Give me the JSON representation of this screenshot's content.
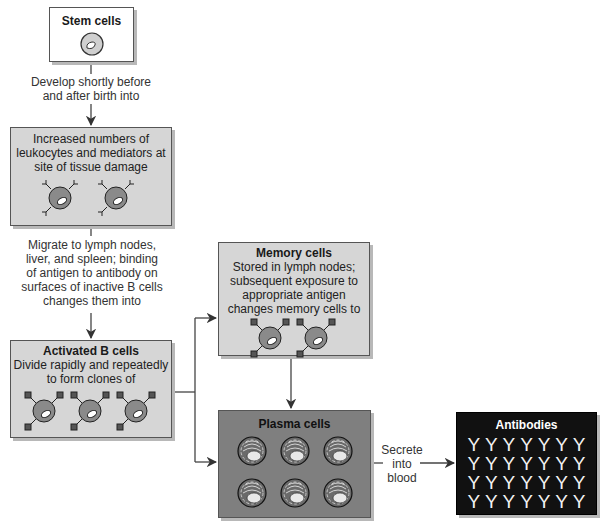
{
  "diagram": {
    "type": "flowchart",
    "topic": "B cell development and antibody production"
  },
  "nodes": {
    "stem": {
      "title": "Stem cells",
      "cells": 1
    },
    "leukocytes": {
      "text_lines": [
        "Increased numbers of",
        "leukocytes and mediators at",
        "site of tissue damage"
      ],
      "cells": 2
    },
    "activated": {
      "title": "Activated B cells",
      "text_lines": [
        "Divide rapidly and repeatedly",
        "to form clones of"
      ],
      "cells": 3
    },
    "memory": {
      "title": "Memory cells",
      "text_lines": [
        "Stored in lymph nodes;",
        "subsequent exposure to",
        "appropriate antigen",
        "changes memory cells to"
      ],
      "cells": 2
    },
    "plasma": {
      "title": "Plasma cells",
      "cells": 6
    },
    "antibodies": {
      "title": "Antibodies",
      "glyph": "Y",
      "rows": 4,
      "cols": 7
    }
  },
  "edges": {
    "stem_to_leuko": {
      "lines": [
        "Develop shortly before",
        "and after birth into"
      ]
    },
    "leuko_to_activated": {
      "lines": [
        "Migrate to lymph nodes,",
        "liver, and spleen; binding",
        "of antigen to antibody on",
        "surfaces of inactive B cells",
        "changes them into"
      ]
    },
    "plasma_to_antibodies": {
      "lines": [
        "Secrete",
        "into",
        "blood"
      ]
    }
  },
  "colors": {
    "light_box": "#d6d6d6",
    "plasma_box": "#7f7f7f",
    "antibody_box": "#111111",
    "line": "#444444"
  }
}
